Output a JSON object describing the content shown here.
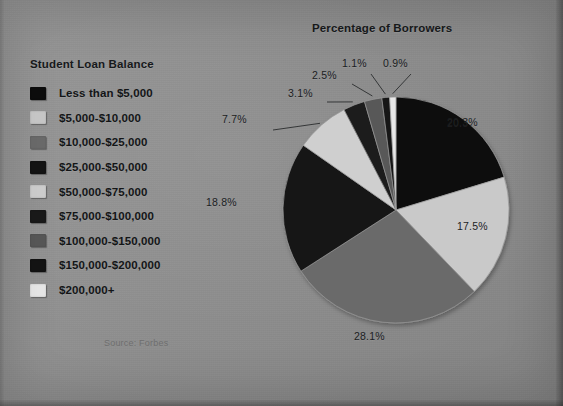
{
  "page": {
    "background_color": "#8d8d8d",
    "source_note": "Source: Forbes"
  },
  "legend": {
    "title": "Student Loan Balance",
    "items": [
      {
        "label": "Less than $5,000",
        "color": "#0d0d0d"
      },
      {
        "label": "$5,000-$10,000",
        "color": "#c9c9c9"
      },
      {
        "label": "$10,000-$25,000",
        "color": "#6b6b6b"
      },
      {
        "label": "$25,000-$50,000",
        "color": "#151515"
      },
      {
        "label": "$50,000-$75,000",
        "color": "#cfcfcf"
      },
      {
        "label": "$75,000-$100,000",
        "color": "#1a1a1a"
      },
      {
        "label": "$100,000-$150,000",
        "color": "#585858"
      },
      {
        "label": "$150,000-$200,000",
        "color": "#141414"
      },
      {
        "label": "$200,000+",
        "color": "#e8e8e8"
      }
    ]
  },
  "chart_data": {
    "type": "pie",
    "title": "Percentage of Borrowers",
    "xlabel": "",
    "ylabel": "",
    "legend_position": "left",
    "grid": false,
    "start_angle_deg": 0,
    "direction": "clockwise",
    "categories": [
      "Less than $5,000",
      "$5,000-$10,000",
      "$10,000-$25,000",
      "$25,000-$50,000",
      "$50,000-$75,000",
      "$75,000-$100,000",
      "$100,000-$150,000",
      "$150,000-$200,000",
      "$200,000+"
    ],
    "values": [
      20.3,
      17.5,
      28.1,
      18.8,
      7.7,
      3.1,
      2.5,
      1.1,
      0.9
    ],
    "value_unit": "%",
    "labels": [
      "20.3%",
      "17.5%",
      "28.1%",
      "18.8%",
      "7.7%",
      "3.1%",
      "2.5%",
      "1.1%",
      "0.9%"
    ],
    "colors": [
      "#0d0d0d",
      "#c9c9c9",
      "#6b6b6b",
      "#151515",
      "#cfcfcf",
      "#1a1a1a",
      "#585858",
      "#141414",
      "#e8e8e8"
    ],
    "slices": [
      {
        "label": "Less than $5,000",
        "value": 20.3,
        "text": "20.3%",
        "color": "#0d0d0d",
        "leader": false
      },
      {
        "label": "$5,000-$10,000",
        "value": 17.5,
        "text": "17.5%",
        "color": "#c9c9c9",
        "leader": false
      },
      {
        "label": "$10,000-$25,000",
        "value": 28.1,
        "text": "28.1%",
        "color": "#6b6b6b",
        "leader": false
      },
      {
        "label": "$25,000-$50,000",
        "value": 18.8,
        "text": "18.8%",
        "color": "#151515",
        "leader": false
      },
      {
        "label": "$50,000-$75,000",
        "value": 7.7,
        "text": "7.7%",
        "color": "#cfcfcf",
        "leader": true
      },
      {
        "label": "$75,000-$100,000",
        "value": 3.1,
        "text": "3.1%",
        "color": "#1a1a1a",
        "leader": true
      },
      {
        "label": "$100,000-$150,000",
        "value": 2.5,
        "text": "2.5%",
        "color": "#585858",
        "leader": true
      },
      {
        "label": "$150,000-$200,000",
        "value": 1.1,
        "text": "1.1%",
        "color": "#141414",
        "leader": true
      },
      {
        "label": "$200,000+",
        "value": 0.9,
        "text": "0.9%",
        "color": "#e8e8e8",
        "leader": true
      }
    ],
    "total": 100.0
  }
}
